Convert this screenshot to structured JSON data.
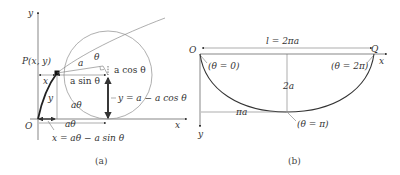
{
  "figure_a": {
    "caption": "(a)",
    "axis_x_label": "x",
    "axis_y_label": "y",
    "origin_label": "O",
    "point_label": "P(x, y)",
    "radius_label": "a",
    "angle_label": "θ",
    "a_cos_label": "a cos θ",
    "a_sin_label": "a sin θ",
    "x_segment_label": "x",
    "y_segment_label": "y",
    "arc_label": "aθ",
    "rolled_label": "aθ",
    "y_formula": "y = a − a cos θ",
    "x_formula": "x = aθ − a sin θ"
  },
  "figure_b": {
    "caption": "(b)",
    "origin_label": "O",
    "end_label": "Q",
    "axis_x_label": "x",
    "axis_y_label": "y",
    "length_label": "l = 2πa",
    "depth_label": "2a",
    "half_width_label": "πa",
    "theta_start": "(θ = 0)",
    "theta_end": "(θ = 2π)",
    "theta_mid": "(θ = π)"
  }
}
